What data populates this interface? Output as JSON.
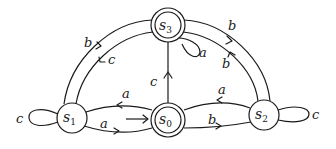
{
  "diagram": {
    "type": "finite-automaton",
    "states": [
      {
        "id": "s0",
        "base": "s",
        "sub": "0",
        "accepting": true,
        "initial": true
      },
      {
        "id": "s1",
        "base": "s",
        "sub": "1",
        "accepting": false,
        "initial": false
      },
      {
        "id": "s2",
        "base": "s",
        "sub": "2",
        "accepting": false,
        "initial": false
      },
      {
        "id": "s3",
        "base": "s",
        "sub": "3",
        "accepting": true,
        "initial": false
      }
    ],
    "transitions": [
      {
        "from": "s0",
        "to": "s1",
        "label": "a"
      },
      {
        "from": "s1",
        "to": "s0",
        "label": "a"
      },
      {
        "from": "s0",
        "to": "s2",
        "label": "b"
      },
      {
        "from": "s2",
        "to": "s0",
        "label": "a"
      },
      {
        "from": "s0",
        "to": "s3",
        "label": "c"
      },
      {
        "from": "s1",
        "to": "s3",
        "label": "b"
      },
      {
        "from": "s3",
        "to": "s1",
        "label": "c"
      },
      {
        "from": "s3",
        "to": "s2",
        "label": "b"
      },
      {
        "from": "s2",
        "to": "s3",
        "label": "b"
      },
      {
        "from": "s1",
        "to": "s1",
        "label": "c"
      },
      {
        "from": "s2",
        "to": "s2",
        "label": "c"
      },
      {
        "from": "s3",
        "to": "s3",
        "label": "a"
      }
    ],
    "labels": {
      "s0_s1": "a",
      "s1_s0": "a",
      "s0_s2": "b",
      "s2_s0": "a",
      "s0_s3": "c",
      "s1_s3": "b",
      "s3_s1": "c",
      "s3_s2": "b",
      "s2_s3": "b",
      "s1_loop": "c",
      "s2_loop": "c",
      "s3_loop": "a"
    },
    "state_labels": {
      "s0": {
        "base": "s",
        "sub": "0"
      },
      "s1": {
        "base": "s",
        "sub": "1"
      },
      "s2": {
        "base": "s",
        "sub": "2"
      },
      "s3": {
        "base": "s",
        "sub": "3"
      }
    }
  }
}
